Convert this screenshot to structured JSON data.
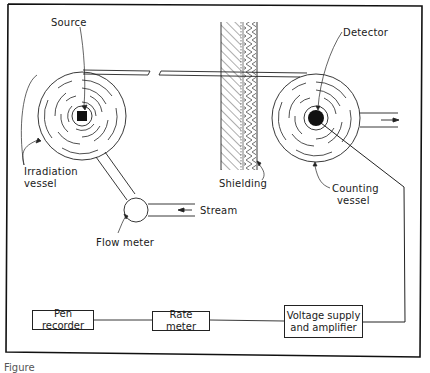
{
  "diagram": {
    "labels": {
      "source": "Source",
      "detector": "Detector",
      "irradiation_vessel_line1": "Irradiation",
      "irradiation_vessel_line2": "vessel",
      "shielding": "Shielding",
      "counting_vessel_line1": "Counting",
      "counting_vessel_line2": "vessel",
      "stream": "Stream",
      "flow_meter": "Flow meter"
    },
    "boxes": {
      "pen_recorder": "Pen recorder",
      "rate_meter": "Rate meter",
      "voltage_supply_line1": "Voltage supply",
      "voltage_supply_line2": "and amplifier"
    },
    "caption": "Figure"
  }
}
